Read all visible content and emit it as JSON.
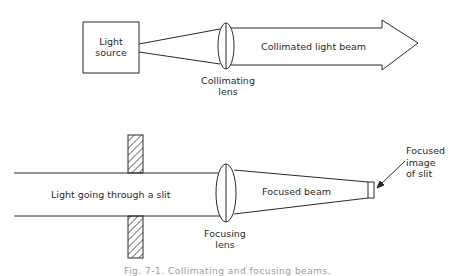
{
  "top_diagram": {
    "source_label_line1": "Light",
    "source_label_line2": "source",
    "lens_label_line1": "Collimating",
    "lens_label_line2": "lens",
    "beam_label": "Collimated light beam"
  },
  "bottom_diagram": {
    "incoming_label": "Light going through a slit",
    "lens_label_line1": "Focusing",
    "lens_label_line2": "lens",
    "beam_label": "Focused beam",
    "image_label_line1": "Focused",
    "image_label_line2": "image",
    "image_label_line3": "of slit"
  },
  "caption": "Fig. 7-1. Collimating and focusing beams.",
  "colors": {
    "stroke": "#2a2a2a",
    "background": "#ffffff"
  }
}
